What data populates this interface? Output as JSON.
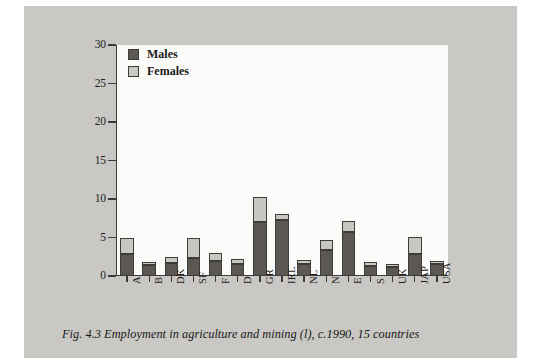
{
  "figure": {
    "caption": "Fig. 4.3  Employment in agriculture and mining (l), c.1990, 15 countries"
  },
  "legend": {
    "position": "top-left-inside",
    "items": [
      {
        "label": "Males",
        "color": "#5b5853",
        "icon": "legend-swatch-icon"
      },
      {
        "label": "Females",
        "color": "#c9c7c2",
        "icon": "legend-swatch-icon"
      }
    ]
  },
  "axes": {
    "y": {
      "min": 0,
      "max": 30,
      "step": 5,
      "ticks": [
        "0",
        "5",
        "10",
        "15",
        "20",
        "25",
        "30"
      ],
      "label": ""
    },
    "x": {
      "label": "",
      "ticks": [
        "A",
        "B",
        "DK",
        "SF",
        "F",
        "D",
        "GR",
        "IRL",
        "NL",
        "N",
        "E",
        "S",
        "UK",
        "JAP",
        "USA"
      ]
    }
  },
  "chart_data": {
    "type": "bar",
    "stacked": true,
    "title": "Fig. 4.3  Employment in agriculture and mining (l), c.1990, 15 countries",
    "xlabel": "",
    "ylabel": "",
    "ylim": [
      0,
      30
    ],
    "grid": false,
    "legend_position": "top-left-inside",
    "categories": [
      "A",
      "B",
      "DK",
      "SF",
      "F",
      "D",
      "GR",
      "IRL",
      "NL",
      "N",
      "E",
      "S",
      "UK",
      "JAP",
      "USA"
    ],
    "series": [
      {
        "name": "Males",
        "color": "#5b5853",
        "values": [
          2.8,
          1.4,
          1.7,
          2.3,
          2.0,
          1.6,
          7.0,
          7.3,
          1.6,
          3.4,
          5.7,
          1.3,
          1.2,
          2.9,
          1.5
        ]
      },
      {
        "name": "Females",
        "color": "#c9c7c2",
        "values": [
          2.2,
          0.4,
          0.8,
          2.7,
          1.0,
          0.6,
          3.3,
          0.7,
          0.5,
          1.3,
          1.4,
          0.5,
          0.4,
          2.2,
          0.4
        ]
      }
    ],
    "totals": [
      5.0,
      1.8,
      2.5,
      5.0,
      3.0,
      2.2,
      10.3,
      8.0,
      2.1,
      4.7,
      7.1,
      1.8,
      1.6,
      5.1,
      1.9
    ]
  },
  "colors": {
    "page_background": "#c9c8c4",
    "plot_background": "#fbfbf9",
    "axis": "#3b3b38",
    "males": "#5b5853",
    "females": "#c9c7c2"
  }
}
